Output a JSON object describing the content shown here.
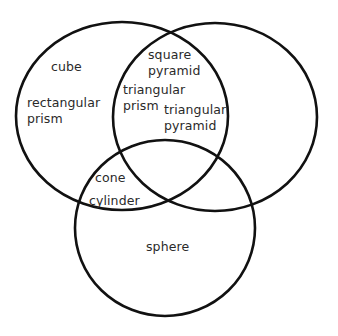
{
  "diagram": {
    "type": "venn",
    "sets": [
      {
        "id": "left",
        "cx": 122,
        "cy": 116,
        "rx": 106,
        "ry": 94
      },
      {
        "id": "right",
        "cx": 215,
        "cy": 117,
        "rx": 102,
        "ry": 94
      },
      {
        "id": "bottom",
        "cx": 165,
        "cy": 228,
        "rx": 90,
        "ry": 88
      }
    ],
    "stroke_color": "#111111",
    "regions": {
      "left_only": {
        "items": [
          "cube",
          "rectangular\nprism"
        ]
      },
      "left_right": {
        "items": [
          "square\npyramid",
          "triangular\nprism",
          "triangular\npyramid"
        ]
      },
      "left_bottom": {
        "items": [
          "cone",
          "cylinder"
        ]
      },
      "bottom_only": {
        "items": [
          "sphere"
        ]
      },
      "right_only": {
        "items": []
      },
      "right_bottom": {
        "items": []
      },
      "all_three": {
        "items": []
      }
    }
  },
  "labels": {
    "cube": "cube",
    "rectangular_prism": "rectangular\nprism",
    "square_pyramid": "square\npyramid",
    "triangular_prism": "triangular\nprism",
    "triangular_pyramid": "triangular\npyramid",
    "cone": "cone",
    "cylinder": "cylinder",
    "sphere": "sphere"
  }
}
